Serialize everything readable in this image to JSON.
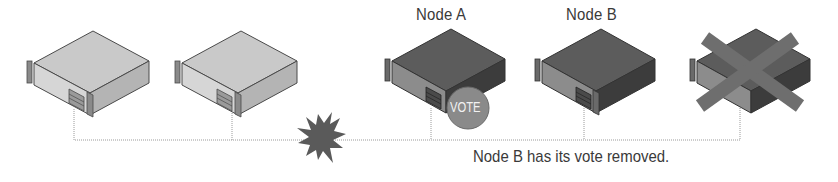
{
  "diagram": {
    "nodes": [
      {
        "id": "server-1",
        "label": "",
        "state": "normal",
        "x": 27
      },
      {
        "id": "server-2",
        "label": "",
        "state": "normal",
        "x": 175
      },
      {
        "id": "node-a",
        "label": "Node A",
        "state": "has-vote",
        "x": 383
      },
      {
        "id": "node-b",
        "label": "Node B",
        "state": "vote-removed",
        "x": 535
      },
      {
        "id": "server-5",
        "label": "",
        "state": "failed",
        "x": 690
      }
    ],
    "vote_badge": "VOTE",
    "caption": "Node B has its vote removed.",
    "network_break_icon": "explosion-icon",
    "colors": {
      "light_server": "#c8c8c8",
      "dark_server": "#5a5a5a",
      "vote_badge": "#8a8a8a",
      "cross": "#6e6e6e",
      "line": "#999999",
      "text": "#3a3a3a"
    }
  }
}
